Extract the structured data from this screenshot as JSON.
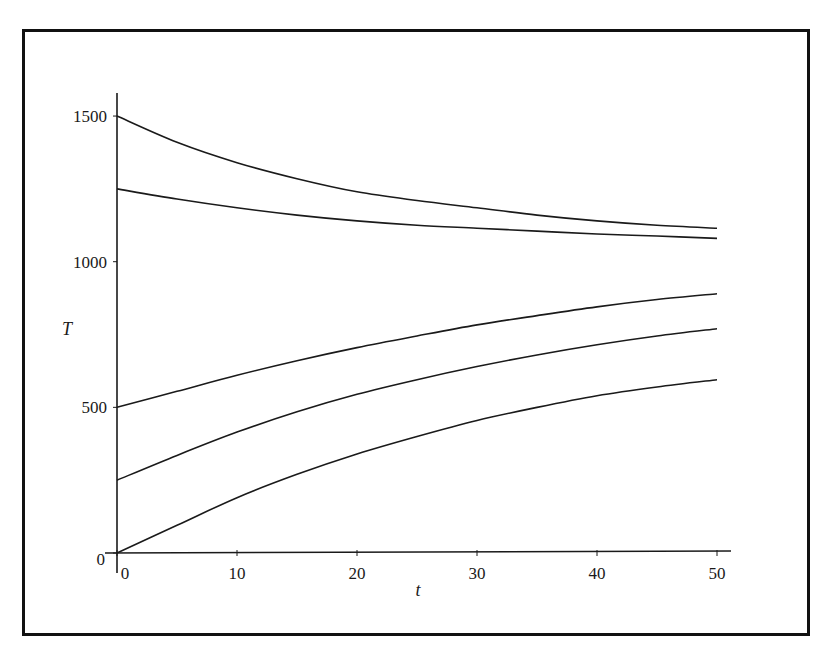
{
  "chart_data": {
    "type": "line",
    "title": "",
    "xlabel": "t",
    "ylabel": "T",
    "xlim": [
      0,
      50
    ],
    "ylim": [
      0,
      1500
    ],
    "grid": false,
    "legend": null,
    "x_ticks": [
      0,
      10,
      20,
      30,
      40,
      50
    ],
    "y_ticks": [
      0,
      500,
      1000,
      1500
    ],
    "x_tick_labels": [
      "0",
      "10",
      "20",
      "30",
      "40",
      "50"
    ],
    "y_tick_labels": [
      "0",
      "500",
      "1000",
      "1500"
    ],
    "x": [
      0,
      5,
      10,
      15,
      20,
      25,
      30,
      35,
      40,
      45,
      50
    ],
    "series": [
      {
        "name": "T0=1500",
        "values": [
          1500,
          1410,
          1340,
          1285,
          1240,
          1210,
          1185,
          1160,
          1140,
          1125,
          1115
        ]
      },
      {
        "name": "T0=1250",
        "values": [
          1250,
          1215,
          1185,
          1160,
          1140,
          1125,
          1115,
          1105,
          1095,
          1088,
          1080
        ]
      },
      {
        "name": "T0=500",
        "values": [
          500,
          555,
          610,
          660,
          705,
          745,
          783,
          815,
          845,
          870,
          890
        ]
      },
      {
        "name": "T0=250",
        "values": [
          250,
          335,
          415,
          485,
          545,
          595,
          640,
          680,
          715,
          745,
          770
        ]
      },
      {
        "name": "T0=0",
        "values": [
          0,
          95,
          190,
          270,
          340,
          400,
          455,
          500,
          540,
          570,
          595
        ]
      },
      {
        "name": "t-axis baseline",
        "values": [
          0,
          0,
          0,
          0,
          0,
          0,
          0,
          0,
          0,
          0,
          0
        ]
      }
    ]
  },
  "plot_area": {
    "x0": 117,
    "x1": 717,
    "y0": 553,
    "y_per_unit": 0.2913
  }
}
